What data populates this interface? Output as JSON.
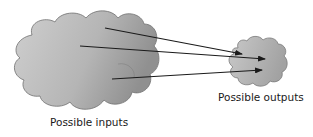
{
  "diagram": {
    "inputs_label": "Possible inputs",
    "outputs_label": "Possible outputs",
    "arrow_count": 3,
    "colors": {
      "cloud_fill_light": "#c8c8c8",
      "cloud_fill_dark": "#9a9a9a",
      "cloud_stroke": "#6e6e6e",
      "arrow": "#1a1a1a"
    }
  }
}
